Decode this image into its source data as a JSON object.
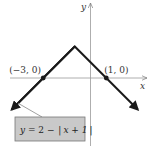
{
  "chart_data": {
    "type": "line",
    "title": "",
    "xlabel": "x",
    "ylabel": "y",
    "xlim": [
      -5.7,
      3.8
    ],
    "ylim": [
      -4.2,
      5.0
    ],
    "grid": false,
    "series": [
      {
        "name": "y = 2 − |x + 1|",
        "x": [
          -5,
          -1,
          3
        ],
        "y": [
          -2,
          2,
          -2
        ],
        "arrows_both_ends": true,
        "color": "#1a1a1a"
      }
    ],
    "points": [
      {
        "x": -3,
        "y": 0,
        "label": "(−3, 0)"
      },
      {
        "x": 1,
        "y": 0,
        "label": "(1, 0)"
      }
    ],
    "annotation": {
      "text_prefix": "y = 2 − ",
      "abs_arg": "x + 1",
      "points_to_x": -4.6,
      "box_color": "#c9c9c9",
      "position": "bottom-left"
    }
  }
}
